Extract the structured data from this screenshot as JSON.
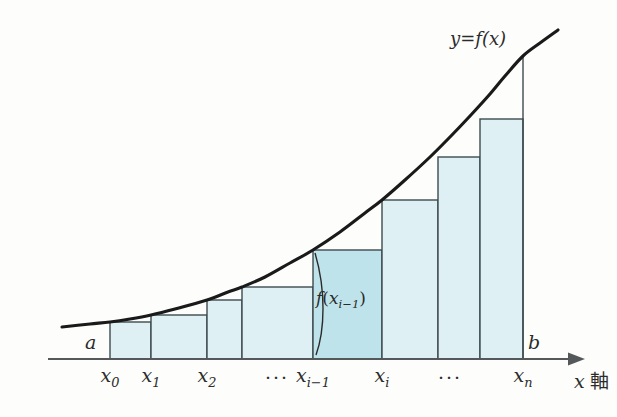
{
  "figure": {
    "background_color": "#fdfdfb",
    "ink_color": "#2b2b2b",
    "bar_fill_color": "#dff0f4",
    "bar_highlight_fill_color": "#bfe3ea",
    "bar_stroke_color": "#3d4a4e",
    "curve_color": "#1a1a1a",
    "axis_color": "#55585a"
  },
  "labels": {
    "curve_label": "y=f(x)",
    "lower_bound": "a",
    "upper_bound": "b",
    "height_label_f": "f",
    "height_label_open": "(",
    "height_label_x": "x",
    "height_label_sub": "i−1",
    "height_label_close": ")",
    "axis_name_x": "x",
    "axis_name_jp": "軸",
    "ellipsis": "···"
  },
  "ticks": [
    {
      "id": "x0",
      "base": "x",
      "sub": "0",
      "x": 110
    },
    {
      "id": "x1",
      "base": "x",
      "sub": "1",
      "x": 151
    },
    {
      "id": "x2",
      "base": "x",
      "sub": "2",
      "x": 207
    },
    {
      "id": "dots1",
      "base": "",
      "sub": "",
      "x": 277
    },
    {
      "id": "xi-1",
      "base": "x",
      "sub": "i−1",
      "x": 313
    },
    {
      "id": "xi",
      "base": "x",
      "sub": "i",
      "x": 382
    },
    {
      "id": "dots2",
      "base": "",
      "sub": "",
      "x": 450
    },
    {
      "id": "xn",
      "base": "x",
      "sub": "n",
      "x": 523
    }
  ],
  "chart_data": {
    "type": "area",
    "xlabel": "x 軸",
    "ylabel": "",
    "curve_label": "y=f(x)",
    "grid": false,
    "legend": "none",
    "axis_baseline_y": 359,
    "curve_points": [
      [
        62,
        327
      ],
      [
        90,
        324
      ],
      [
        110,
        322
      ],
      [
        130,
        319
      ],
      [
        151,
        315
      ],
      [
        175,
        309
      ],
      [
        207,
        300
      ],
      [
        228,
        292
      ],
      [
        242,
        287
      ],
      [
        265,
        277
      ],
      [
        290,
        263
      ],
      [
        313,
        250
      ],
      [
        340,
        232
      ],
      [
        365,
        213
      ],
      [
        382,
        200
      ],
      [
        405,
        180
      ],
      [
        430,
        157
      ],
      [
        450,
        137
      ],
      [
        470,
        116
      ],
      [
        490,
        94
      ],
      [
        505,
        76
      ],
      [
        523,
        56
      ],
      [
        540,
        43
      ],
      [
        558,
        30
      ]
    ],
    "bars": [
      {
        "index": 0,
        "left_tick": "x0",
        "x_left": 110,
        "x_right": 151,
        "top_y": 322,
        "height_px": 37,
        "highlight": false
      },
      {
        "index": 1,
        "left_tick": "x1",
        "x_left": 151,
        "x_right": 207,
        "top_y": 315,
        "height_px": 44,
        "highlight": false
      },
      {
        "index": 2,
        "left_tick": "x2",
        "x_left": 207,
        "x_right": 242,
        "top_y": 300,
        "height_px": 59,
        "highlight": false
      },
      {
        "index": 3,
        "left_tick": "dots1",
        "x_left": 242,
        "x_right": 313,
        "top_y": 287,
        "height_px": 72,
        "highlight": false
      },
      {
        "index": 4,
        "left_tick": "xi-1",
        "x_left": 313,
        "x_right": 382,
        "top_y": 250,
        "height_px": 109,
        "highlight": true
      },
      {
        "index": 5,
        "left_tick": "xi",
        "x_left": 382,
        "x_right": 438,
        "top_y": 200,
        "height_px": 159,
        "highlight": false
      },
      {
        "index": 6,
        "left_tick": "dots2",
        "x_left": 438,
        "x_right": 480,
        "top_y": 157,
        "height_px": 202,
        "highlight": false
      },
      {
        "index": 7,
        "left_tick": "xn",
        "x_left": 480,
        "x_right": 523,
        "top_y": 119,
        "height_px": 240,
        "highlight": false
      }
    ],
    "annotations": [
      {
        "name": "curve-label",
        "text": "y=f(x)",
        "x": 450,
        "y": 40
      },
      {
        "name": "lower-bound",
        "text": "a",
        "x": 85,
        "y": 345
      },
      {
        "name": "upper-bound",
        "text": "b",
        "x": 528,
        "y": 345
      },
      {
        "name": "height-label",
        "text": "f(x_{i-1})",
        "x": 316,
        "y": 300
      }
    ]
  }
}
